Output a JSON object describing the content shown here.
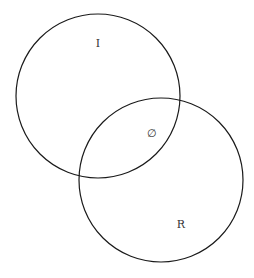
{
  "diagram": {
    "type": "venn",
    "sets": [
      {
        "id": "I",
        "label": "I",
        "cx": 98,
        "cy": 96,
        "r": 82
      },
      {
        "id": "R",
        "label": "R",
        "cx": 161,
        "cy": 180,
        "r": 82
      }
    ],
    "intersection": {
      "label": "∅"
    },
    "colors": {
      "stroke": "#1a1a1a",
      "text": "#333333",
      "background": "#ffffff"
    }
  }
}
